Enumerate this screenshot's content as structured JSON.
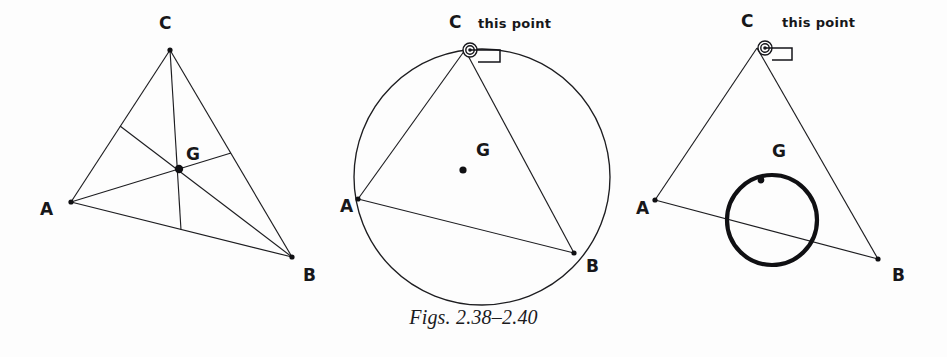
{
  "page": {
    "caption": "Figs. 2.38–2.40",
    "background_color": "#fdfdfd",
    "ink_color": "#17171a"
  },
  "figures": [
    {
      "id": "fig-2-38",
      "name": "triangle-with-medians-and-centroid",
      "labels": {
        "A": "A",
        "B": "B",
        "C": "C",
        "G": "G"
      },
      "vertices": {
        "A": [
          71,
          202
        ],
        "B": [
          292,
          257
        ],
        "C": [
          170,
          50
        ],
        "G": [
          179,
          169
        ]
      },
      "label_positions": {
        "A": [
          40,
          215
        ],
        "B": [
          303,
          281
        ],
        "C": [
          159,
          29
        ],
        "G": [
          186,
          160
        ]
      },
      "midpoints": {
        "AB": [
          181,
          230
        ],
        "BC": [
          231,
          153
        ],
        "CA": [
          120,
          126
        ]
      }
    },
    {
      "id": "fig-2-39",
      "name": "triangle-inscribed-in-circumcircle",
      "labels": {
        "A": "A",
        "B": "B",
        "C": "C",
        "G": "G"
      },
      "vertices": {
        "A": [
          358,
          199
        ],
        "B": [
          574,
          253
        ],
        "C": [
          465,
          50
        ],
        "G": [
          463,
          170
        ]
      },
      "label_positions": {
        "A": [
          340,
          212
        ],
        "B": [
          586,
          272
        ],
        "C": [
          449,
          28
        ],
        "G": [
          476,
          156
        ]
      },
      "circle": {
        "center": [
          482,
          177
        ],
        "radius": 128
      },
      "annotation": {
        "text": "this point",
        "text_position": [
          478,
          28
        ],
        "marker_position": [
          470,
          50
        ]
      }
    },
    {
      "id": "fig-2-40",
      "name": "triangle-with-centroid-locus-circle",
      "labels": {
        "A": "A",
        "B": "B",
        "C": "C",
        "G": "G"
      },
      "vertices": {
        "A": [
          655,
          200
        ],
        "B": [
          878,
          259
        ],
        "C": [
          757,
          48
        ],
        "G": [
          763,
          168
        ]
      },
      "label_positions": {
        "A": [
          636,
          214
        ],
        "B": [
          892,
          281
        ],
        "C": [
          741,
          27
        ],
        "G": [
          772,
          157
        ]
      },
      "locus_circle": {
        "center": [
          772,
          220
        ],
        "radius": 45,
        "stroke_width": 4.2
      },
      "annotation": {
        "text": "this point",
        "text_position": [
          782,
          27
        ],
        "marker_position": [
          765,
          48
        ]
      }
    }
  ]
}
